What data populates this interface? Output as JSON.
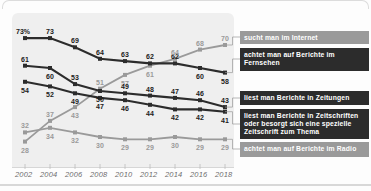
{
  "chart_data": {
    "type": "line",
    "title": "",
    "subtitle": "",
    "xlabel": "",
    "ylabel": "",
    "x": [
      2002,
      2004,
      2006,
      2008,
      2010,
      2012,
      2014,
      2016,
      2018
    ],
    "categories": [
      "2002",
      "2004",
      "2006",
      "2008",
      "2010",
      "2012",
      "2014",
      "2016",
      "2018"
    ],
    "ylim": [
      20,
      80
    ],
    "grid": false,
    "legend_position": "right",
    "unit_suffix": "%",
    "first_point_label": "73%",
    "series": [
      {
        "name": "achtet man auf Berichte im Fernsehen",
        "key": "tv",
        "color": "#2c2c2c",
        "marker": "square",
        "values": [
          73,
          73,
          69,
          64,
          63,
          62,
          62,
          60,
          58
        ],
        "labels": [
          "73%",
          "73",
          "69",
          "64",
          "63",
          "62",
          "62",
          "60",
          "58"
        ]
      },
      {
        "name": "sucht man im Internet",
        "key": "internet",
        "color": "#9a9a9a",
        "marker": "square",
        "values": [
          28,
          37,
          43,
          51,
          57,
          61,
          64,
          68,
          70
        ],
        "labels": [
          "28",
          "37",
          "43",
          "51",
          "57",
          "61",
          "64",
          "68",
          "70"
        ]
      },
      {
        "name": "liest man Berichte in Zeitungen",
        "key": "newspapers",
        "color": "#2c2c2c",
        "marker": "square",
        "values": [
          61,
          60,
          53,
          50,
          49,
          48,
          47,
          46,
          43
        ],
        "labels": [
          "61",
          "60",
          "53",
          "50",
          "49",
          "48",
          "47",
          "46",
          "43"
        ]
      },
      {
        "name": "liest man Berichte in Zeitschriften oder besorgt sich eine spezielle Zeitschrift zum Thema",
        "key": "magazines",
        "color": "#2c2c2c",
        "marker": "square",
        "values": [
          54,
          52,
          49,
          47,
          46,
          44,
          42,
          42,
          41
        ],
        "labels": [
          "54",
          "52",
          "49",
          "47",
          "46",
          "44",
          "42",
          "42",
          "41"
        ]
      },
      {
        "name": "achtet man auf Berichte im Radio",
        "key": "radio",
        "color": "#9a9a9a",
        "marker": "square",
        "values": [
          32,
          34,
          32,
          30,
          29,
          29,
          30,
          29,
          29
        ],
        "labels": [
          "32",
          "34",
          "32",
          "30",
          "29",
          "29",
          "30",
          "29",
          "29"
        ]
      }
    ]
  },
  "legend": {
    "internet": "sucht man im Internet",
    "tv": "achtet man auf Berichte im Fernsehen",
    "newspapers": "liest man Berichte in Zeitungen",
    "magazines": "liest man Berichte in Zeitschriften oder besorgt sich eine spezielle Zeitschrift zum Thema",
    "radio": "achtet man auf Berichte im Radio"
  },
  "colors": {
    "dark_series": "#2c2c2c",
    "light_series": "#9a9a9a",
    "plot_background": "#efefef",
    "legend_dark": "#2c2c2c",
    "legend_gray": "#9a9a9a",
    "axis_text": "#6d6d6d"
  }
}
